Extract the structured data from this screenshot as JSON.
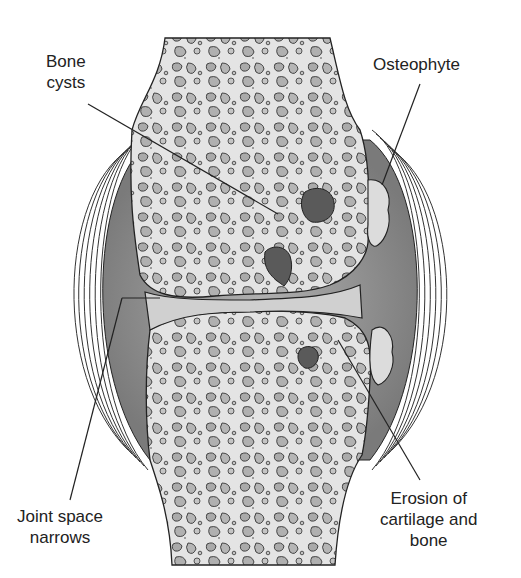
{
  "diagram": {
    "labels": {
      "bone_cysts": {
        "line1": "Bone",
        "line2": "cysts"
      },
      "osteophyte": {
        "line1": "Osteophyte"
      },
      "joint_space": {
        "line1": "Joint space",
        "line2": "narrows"
      },
      "erosion": {
        "line1": "Erosion of",
        "line2": "cartilage and",
        "line3": "bone"
      }
    },
    "colors": {
      "background": "#ffffff",
      "bone": "#e6e6e6",
      "trabecula": "#b4b4b4",
      "cyst": "#5a5a5a",
      "capsule_fill": "#8c8c8c",
      "cartilage": "#d2d2d2",
      "outline": "#222222"
    }
  }
}
